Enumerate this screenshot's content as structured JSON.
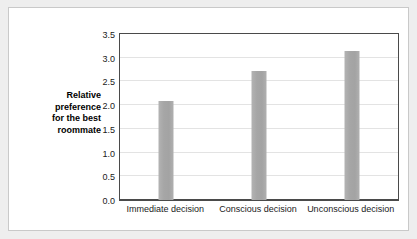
{
  "chart_data": {
    "type": "bar",
    "title": "",
    "xlabel": "",
    "ylabel": "Relative preference for the best roommate",
    "ylabel_lines": [
      "Relative",
      "preference",
      "for the best",
      "roommate"
    ],
    "categories": [
      "Immediate decision",
      "Conscious decision",
      "Unconscious decision"
    ],
    "values": [
      2.08,
      2.72,
      3.15
    ],
    "ylim": [
      0.0,
      3.5
    ],
    "ytick_labels": [
      "0.0",
      "0.5",
      "1.0",
      "1.5",
      "2.0",
      "2.5",
      "3.0",
      "3.5"
    ],
    "ytick_values": [
      0.0,
      0.5,
      1.0,
      1.5,
      2.0,
      2.5,
      3.0,
      3.5
    ],
    "grid": true,
    "legend": false,
    "bar_color": "#a8a8a8",
    "grid_color": "#e3e3e3",
    "axis_color": "#4a4a4a",
    "plot_background": "#ffffff",
    "page_background": "#eeeeee"
  }
}
